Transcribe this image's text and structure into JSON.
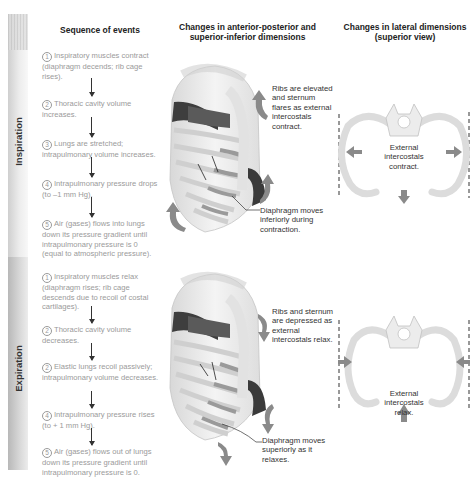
{
  "columns": {
    "sequence_title": "Sequence of events",
    "ap_si_title_line1": "Changes in anterior-posterior and",
    "ap_si_title_line2": "superior-inferior dimensions",
    "lateral_title_line1": "Changes in lateral dimensions",
    "lateral_title_line2": "(superior view)"
  },
  "phases": {
    "inspiration": {
      "label": "Inspiration",
      "steps": [
        {
          "num": "1",
          "text": "Inspiratory muscles contract (diaphragm decends; rib cage rises)."
        },
        {
          "num": "2",
          "text": "Thoracic cavity volume increases."
        },
        {
          "num": "3",
          "text": "Lungs are stretched; intrapulmonary volume increases."
        },
        {
          "num": "4",
          "text": "Intrapulmonary pressure drops (to –1 mm Hg)."
        },
        {
          "num": "5",
          "text": "Air (gases) flows into lungs down its pressure gradient until intrapulmonary pressure is 0 (equal to atmospheric pressure)."
        }
      ],
      "ribcage_note": "Ribs are elevated and sternum flares as external intercostals contract.",
      "diaphragm_note": "Diaphragm moves inferiorly during contraction.",
      "lateral_note": "External intercostals contract."
    },
    "expiration": {
      "label": "Expiration",
      "steps": [
        {
          "num": "1",
          "text": "Inspiratory muscles relax (diaphragm rises; rib cage descends due to recoil of costal cartilages)."
        },
        {
          "num": "2",
          "text": "Thoracic cavity volume decreases."
        },
        {
          "num": "2",
          "text": "Elastic lungs recoil passively; intrapulmonary volume decreases."
        },
        {
          "num": "4",
          "text": "Intrapulmonary pressure rises (to + 1 mm Hg)."
        },
        {
          "num": "5",
          "text": "Air (gases) flows out of lungs down its pressure gradient until intrapulmonary pressure is 0."
        }
      ],
      "ribcage_note": "Ribs and sternum are depressed as external intercostals relax.",
      "diaphragm_note": "Diaphragm moves superiorly as it relaxes.",
      "lateral_note": "External intercostals relax."
    }
  },
  "colors": {
    "band_inspiration": "#e4e4e4",
    "band_expiration": "#cccccc",
    "step_text": "#9a9a9a",
    "arrow_fill": "#8a8a8a",
    "bone": "#f0f0f0",
    "bone_outline": "#c8c8c8",
    "muscle_dark": "#444444"
  }
}
